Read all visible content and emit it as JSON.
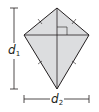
{
  "diagram": {
    "type": "kite",
    "fill_color": "#dcdddf",
    "stroke_color": "#231f20",
    "vertices": {
      "top": [
        57,
        8
      ],
      "left": [
        24,
        35
      ],
      "right": [
        89,
        35
      ],
      "bottom": [
        57,
        89
      ]
    },
    "labels": {
      "d1": {
        "main": "d",
        "sub": "1"
      },
      "d2": {
        "main": "d",
        "sub": "2"
      }
    },
    "marks": {
      "right_angle": true,
      "short_sides_tick": "single",
      "long_sides_tick": "double"
    }
  }
}
